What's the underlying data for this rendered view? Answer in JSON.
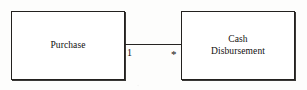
{
  "diagram": {
    "kind": "uml-association-diagram",
    "background_color": "#fdfdfc",
    "line_color": "#262422",
    "text_color": "#100f0e",
    "entities": [
      {
        "id": "purchase",
        "label": "Purchase",
        "x": 11,
        "y": 11,
        "width": 114,
        "height": 69
      },
      {
        "id": "cash-disbursement",
        "label": "Cash\nDisbursement",
        "x": 181,
        "y": 11,
        "width": 114,
        "height": 69
      }
    ],
    "association": {
      "from": "purchase",
      "to": "cash-disbursement",
      "source_multiplicity": "1",
      "target_multiplicity": "*",
      "line_y": 44,
      "line_x_start": 125,
      "line_x_end": 181
    }
  }
}
